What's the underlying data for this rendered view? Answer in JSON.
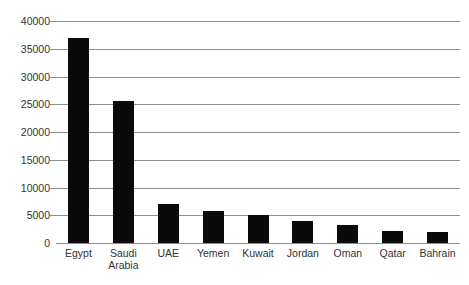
{
  "chart_data": {
    "type": "bar",
    "title": "",
    "subtitle": "",
    "xlabel": "",
    "ylabel": "",
    "categories": [
      "Egypt",
      "Saudi Arabia",
      "UAE",
      "Yemen",
      "Kuwait",
      "Jordan",
      "Oman",
      "Qatar",
      "Bahrain"
    ],
    "category_labels_display": [
      "Egypt",
      "Saudi\nArabia",
      "UAE",
      "Yemen",
      "Kuwait",
      "Jordan",
      "Oman",
      "Qatar",
      "Bahrain"
    ],
    "values": [
      37000,
      25500,
      7000,
      5800,
      5000,
      4000,
      3300,
      2200,
      1900
    ],
    "ylim": [
      0,
      40000
    ],
    "ytick_values": [
      0,
      5000,
      10000,
      15000,
      20000,
      25000,
      30000,
      35000,
      40000
    ],
    "ytick_labels": [
      "0",
      "5000",
      "10000",
      "15000",
      "20000",
      "25000",
      "30000",
      "35000",
      "40000"
    ],
    "grid": true,
    "grid_axis": "y",
    "legend": false,
    "legend_position": "none",
    "bar_color": "#0a0a0a",
    "grid_color": "#8d8d8d",
    "axis_text_color": "#333333",
    "background_color": "#ffffff"
  }
}
